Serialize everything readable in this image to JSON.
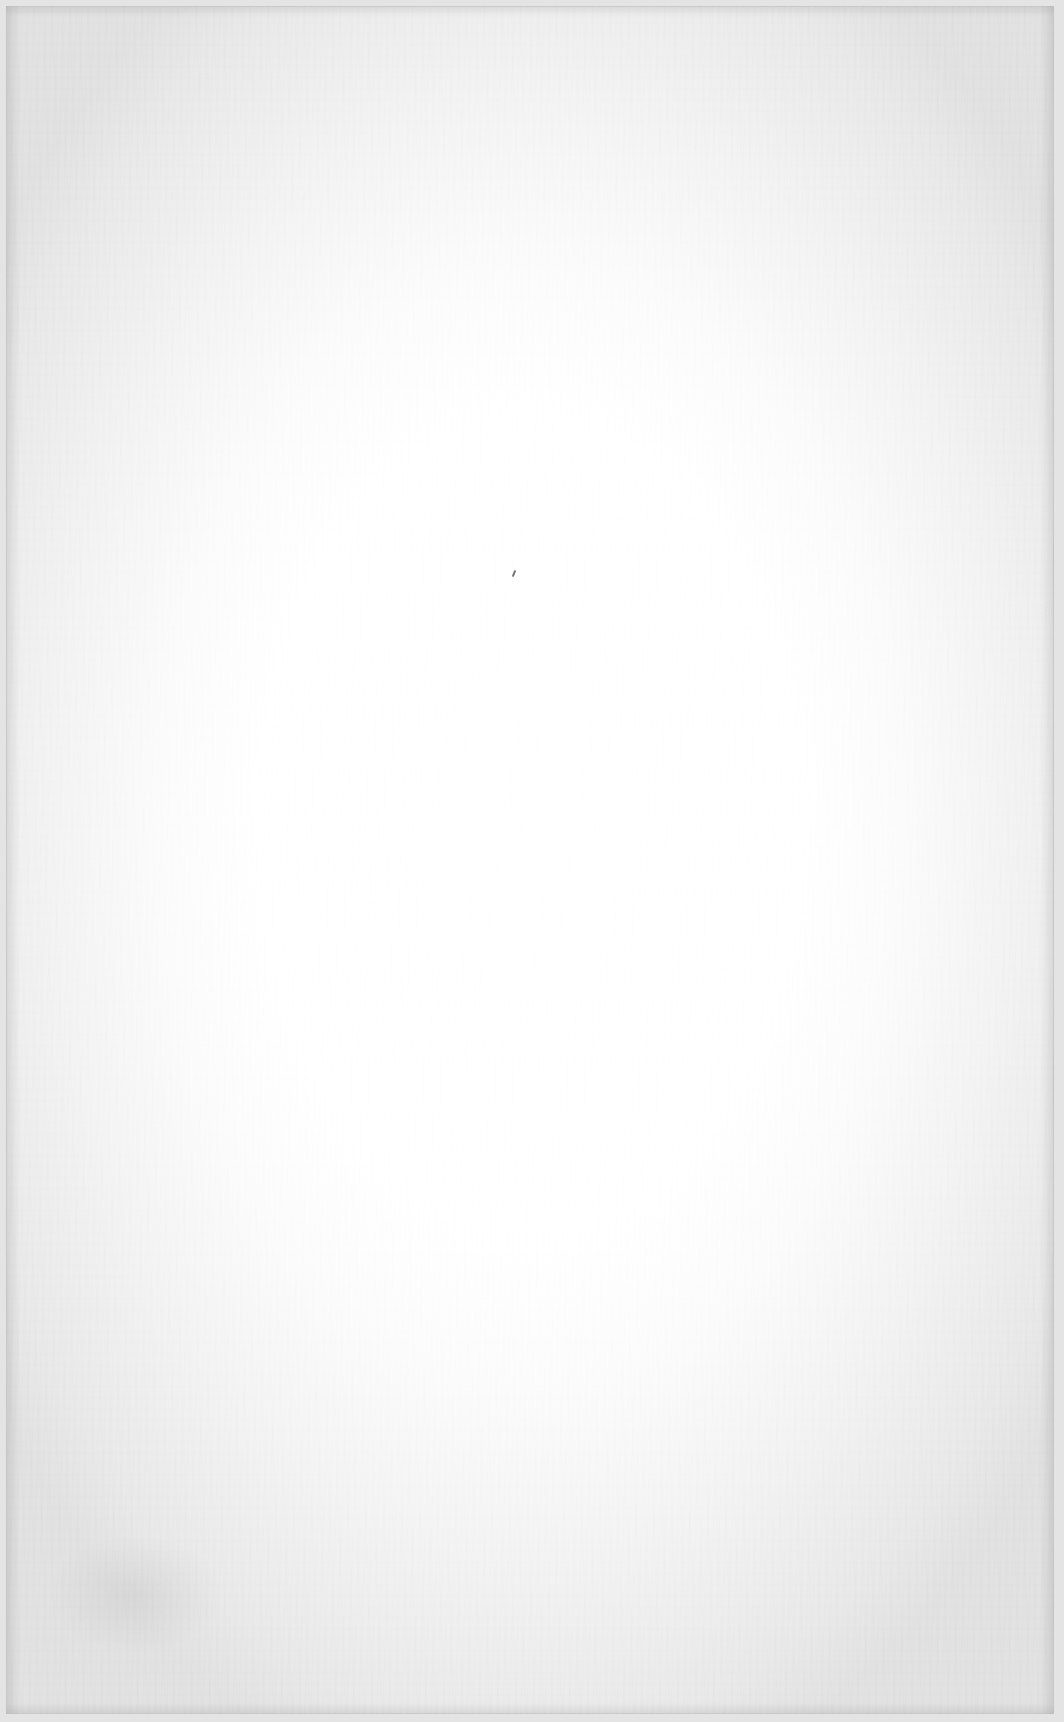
{
  "page": {
    "type": "blank scanned paper",
    "width": 1064,
    "height": 1722,
    "text_content": ""
  },
  "colors": {
    "paper_center": "#ffffff",
    "paper_edge": "#e2e2e2",
    "border": "#d6d6d6",
    "speck": "#5a5a5a"
  },
  "marks": [
    {
      "kind": "speck",
      "x": 513,
      "y": 570
    }
  ]
}
